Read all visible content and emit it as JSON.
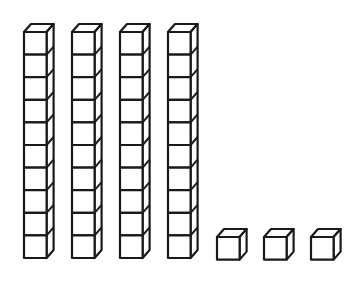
{
  "figure": {
    "description": "Base-ten blocks: 4 tens rods and 3 unit cubes",
    "tens_rods": 4,
    "cubes_per_rod": 10,
    "unit_cubes": 3,
    "represented_value": 43,
    "stroke_color": "#1a1a1a",
    "fill_color": "#ffffff"
  },
  "layout": {
    "rods": [
      {
        "x": 24,
        "top": 32
      },
      {
        "x": 72,
        "top": 32
      },
      {
        "x": 120,
        "top": 32
      },
      {
        "x": 168,
        "top": 32
      }
    ],
    "units": [
      {
        "x": 217,
        "top": 237
      },
      {
        "x": 264,
        "top": 237
      },
      {
        "x": 311,
        "top": 237
      }
    ],
    "cube_size": 22.6,
    "depth_dx": 7,
    "depth_dy": 8
  }
}
